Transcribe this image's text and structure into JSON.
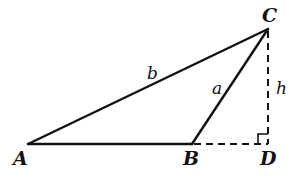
{
  "diagram": {
    "type": "obtuse triangle with altitude",
    "vertices": {
      "A": {
        "label": "A",
        "x": 28,
        "y": 144
      },
      "B": {
        "label": "B",
        "x": 192,
        "y": 144
      },
      "C": {
        "label": "C",
        "x": 268,
        "y": 29
      },
      "D": {
        "label": "D",
        "x": 268,
        "y": 144
      }
    },
    "sides": {
      "b": {
        "label": "b",
        "from": "A",
        "to": "C",
        "style": "solid"
      },
      "a": {
        "label": "a",
        "from": "B",
        "to": "C",
        "style": "solid"
      },
      "c": {
        "from": "A",
        "to": "B",
        "style": "solid"
      }
    },
    "extensions": {
      "BD": {
        "from": "B",
        "to": "D",
        "style": "dashed"
      },
      "h": {
        "label": "h",
        "from": "C",
        "to": "D",
        "style": "dashed"
      }
    },
    "right_angle_at": "D",
    "colors": {
      "stroke": "#111111",
      "background": "#ffffff"
    }
  }
}
